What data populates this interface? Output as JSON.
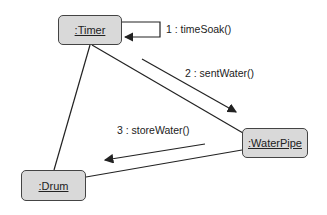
{
  "diagram": {
    "type": "UML communication diagram",
    "objects": [
      {
        "id": "timer",
        "label": ":Timer"
      },
      {
        "id": "waterpipe",
        "label": ":WaterPipe"
      },
      {
        "id": "drum",
        "label": ":Drum"
      }
    ],
    "links": [
      {
        "from": "timer",
        "to": "timer"
      },
      {
        "from": "timer",
        "to": "waterpipe"
      },
      {
        "from": "timer",
        "to": "drum"
      },
      {
        "from": "waterpipe",
        "to": "drum"
      }
    ],
    "messages": [
      {
        "label": "1 : timeSoak()",
        "from": "timer",
        "to": "timer"
      },
      {
        "label": "2 : sentWater()",
        "from": "timer",
        "to": "waterpipe"
      },
      {
        "label": "3 : storeWater()",
        "from": "waterpipe",
        "to": "drum"
      }
    ]
  }
}
